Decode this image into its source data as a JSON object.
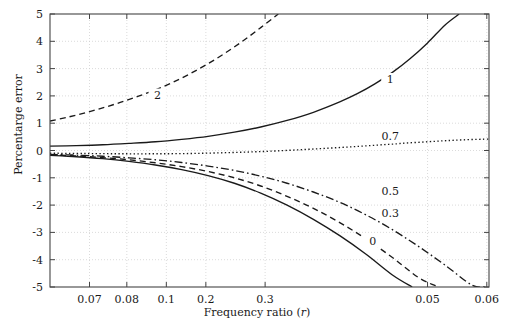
{
  "chart_data": {
    "type": "line",
    "title": "",
    "xlabel": "Frequency ratio (r)",
    "ylabel": "Percentarge error",
    "xscale": "log",
    "x_tick_labels": [
      "0.07",
      "0.08",
      "0.1",
      "0.2",
      "0.3",
      "0.05",
      "0.06"
    ],
    "x_tick_positions": [
      0.09,
      0.175,
      0.265,
      0.355,
      0.49,
      0.86,
      0.995
    ],
    "y_tick_labels": [
      "5",
      "4",
      "3",
      "2",
      "1",
      "0",
      "-1",
      "-2",
      "-3",
      "-4",
      "-5"
    ],
    "ylim": [
      -5,
      5
    ],
    "grid": true,
    "legend": "inline-curve-labels",
    "series": [
      {
        "name": "2",
        "label": "2",
        "style": "dashed",
        "label_pos": {
          "x": 0.245,
          "y": 2.05
        },
        "points": [
          [
            0.0,
            1.08
          ],
          [
            0.04,
            1.22
          ],
          [
            0.08,
            1.38
          ],
          [
            0.12,
            1.56
          ],
          [
            0.16,
            1.76
          ],
          [
            0.2,
            1.98
          ],
          [
            0.24,
            2.22
          ],
          [
            0.28,
            2.5
          ],
          [
            0.32,
            2.82
          ],
          [
            0.36,
            3.18
          ],
          [
            0.4,
            3.58
          ],
          [
            0.44,
            4.02
          ],
          [
            0.48,
            4.5
          ],
          [
            0.52,
            5.0
          ]
        ]
      },
      {
        "name": "1",
        "label": "1",
        "style": "solid",
        "label_pos": {
          "x": 0.775,
          "y": 2.62
        },
        "points": [
          [
            0.0,
            0.16
          ],
          [
            0.06,
            0.18
          ],
          [
            0.12,
            0.21
          ],
          [
            0.18,
            0.26
          ],
          [
            0.24,
            0.32
          ],
          [
            0.3,
            0.41
          ],
          [
            0.36,
            0.52
          ],
          [
            0.42,
            0.67
          ],
          [
            0.48,
            0.86
          ],
          [
            0.54,
            1.1
          ],
          [
            0.6,
            1.4
          ],
          [
            0.66,
            1.78
          ],
          [
            0.7,
            2.08
          ],
          [
            0.74,
            2.44
          ],
          [
            0.78,
            2.86
          ],
          [
            0.82,
            3.36
          ],
          [
            0.86,
            3.94
          ],
          [
            0.9,
            4.6
          ],
          [
            0.932,
            5.0
          ]
        ]
      },
      {
        "name": "0.7",
        "label": "0.7",
        "style": "dotted",
        "label_pos": {
          "x": 0.775,
          "y": 0.52
        },
        "points": [
          [
            0.0,
            -0.1
          ],
          [
            0.08,
            -0.11
          ],
          [
            0.16,
            -0.12
          ],
          [
            0.24,
            -0.12
          ],
          [
            0.32,
            -0.11
          ],
          [
            0.4,
            -0.08
          ],
          [
            0.48,
            -0.04
          ],
          [
            0.56,
            0.02
          ],
          [
            0.64,
            0.09
          ],
          [
            0.72,
            0.17
          ],
          [
            0.8,
            0.26
          ],
          [
            0.88,
            0.34
          ],
          [
            0.94,
            0.39
          ],
          [
            1.0,
            0.42
          ]
        ]
      },
      {
        "name": "0.5",
        "label": "0.5",
        "style": "dashdot",
        "label_pos": {
          "x": 0.775,
          "y": -1.48
        },
        "points": [
          [
            0.0,
            -0.14
          ],
          [
            0.06,
            -0.17
          ],
          [
            0.12,
            -0.21
          ],
          [
            0.18,
            -0.27
          ],
          [
            0.24,
            -0.34
          ],
          [
            0.3,
            -0.44
          ],
          [
            0.36,
            -0.57
          ],
          [
            0.42,
            -0.73
          ],
          [
            0.48,
            -0.94
          ],
          [
            0.54,
            -1.2
          ],
          [
            0.6,
            -1.52
          ],
          [
            0.66,
            -1.9
          ],
          [
            0.72,
            -2.36
          ],
          [
            0.78,
            -2.9
          ],
          [
            0.84,
            -3.52
          ],
          [
            0.9,
            -4.2
          ],
          [
            0.96,
            -4.92
          ],
          [
            0.99,
            -5.0
          ]
        ]
      },
      {
        "name": "0.3",
        "label": "0.3",
        "style": "dashed",
        "label_pos": {
          "x": 0.775,
          "y": -2.28
        },
        "points": [
          [
            0.0,
            -0.16
          ],
          [
            0.06,
            -0.2
          ],
          [
            0.12,
            -0.26
          ],
          [
            0.18,
            -0.34
          ],
          [
            0.24,
            -0.45
          ],
          [
            0.3,
            -0.59
          ],
          [
            0.36,
            -0.77
          ],
          [
            0.42,
            -1.0
          ],
          [
            0.48,
            -1.3
          ],
          [
            0.54,
            -1.68
          ],
          [
            0.6,
            -2.12
          ],
          [
            0.66,
            -2.64
          ],
          [
            0.72,
            -3.24
          ],
          [
            0.78,
            -3.92
          ],
          [
            0.84,
            -4.66
          ],
          [
            0.885,
            -5.0
          ]
        ]
      },
      {
        "name": "0",
        "label": "0",
        "style": "solid",
        "label_pos": {
          "x": 0.735,
          "y": -3.3
        },
        "points": [
          [
            0.0,
            -0.18
          ],
          [
            0.06,
            -0.23
          ],
          [
            0.12,
            -0.3
          ],
          [
            0.18,
            -0.4
          ],
          [
            0.24,
            -0.53
          ],
          [
            0.3,
            -0.7
          ],
          [
            0.36,
            -0.92
          ],
          [
            0.42,
            -1.2
          ],
          [
            0.48,
            -1.56
          ],
          [
            0.54,
            -2.0
          ],
          [
            0.6,
            -2.52
          ],
          [
            0.66,
            -3.12
          ],
          [
            0.72,
            -3.8
          ],
          [
            0.78,
            -4.56
          ],
          [
            0.825,
            -5.0
          ]
        ]
      }
    ]
  },
  "colors": {
    "curve": "#1a1a1a",
    "axis": "#444444",
    "grid": "#cccccc",
    "text": "#1a1a1a"
  }
}
